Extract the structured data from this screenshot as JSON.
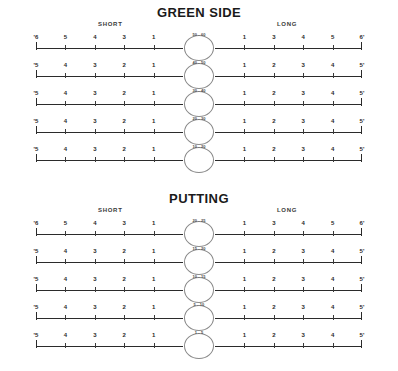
{
  "document": {
    "type": "golf-practice-dispersion-chart"
  },
  "sections": [
    {
      "id": "green-side",
      "title": "GREEN SIDE",
      "zones": {
        "short": "SHORT",
        "long": "LONG"
      },
      "rows": [
        {
          "circle_label": "50 - 60",
          "left_end": "'6",
          "right_end": "6'",
          "left_numbers": [
            "5",
            "4",
            "3",
            "1"
          ],
          "right_numbers": [
            "1",
            "3",
            "4",
            "5"
          ]
        },
        {
          "circle_label": "40 - 50",
          "left_end": "'5",
          "right_end": "5'",
          "left_numbers": [
            "4",
            "3",
            "2",
            "1"
          ],
          "right_numbers": [
            "1",
            "2",
            "3",
            "4"
          ]
        },
        {
          "circle_label": "30 - 40",
          "left_end": "'5",
          "right_end": "5'",
          "left_numbers": [
            "4",
            "3",
            "2",
            "1"
          ],
          "right_numbers": [
            "1",
            "2",
            "3",
            "4"
          ]
        },
        {
          "circle_label": "20 - 30",
          "left_end": "'5",
          "right_end": "5'",
          "left_numbers": [
            "4",
            "3",
            "2",
            "1"
          ],
          "right_numbers": [
            "1",
            "2",
            "3",
            "4"
          ]
        },
        {
          "circle_label": "10 - 20",
          "left_end": "'5",
          "right_end": "5'",
          "left_numbers": [
            "4",
            "3",
            "2",
            "1"
          ],
          "right_numbers": [
            "1",
            "2",
            "3",
            "4"
          ]
        }
      ]
    },
    {
      "id": "putting",
      "title": "PUTTING",
      "zones": {
        "short": "SHORT",
        "long": "LONG"
      },
      "rows": [
        {
          "circle_label": "20 - 25",
          "left_end": "'6",
          "right_end": "6'",
          "left_numbers": [
            "5",
            "4",
            "3",
            "1"
          ],
          "right_numbers": [
            "1",
            "3",
            "4",
            "5"
          ]
        },
        {
          "circle_label": "15 - 20",
          "left_end": "'5",
          "right_end": "5'",
          "left_numbers": [
            "4",
            "3",
            "2",
            "1"
          ],
          "right_numbers": [
            "1",
            "2",
            "3",
            "4"
          ]
        },
        {
          "circle_label": "10 - 15",
          "left_end": "'5",
          "right_end": "5'",
          "left_numbers": [
            "4",
            "3",
            "2",
            "1"
          ],
          "right_numbers": [
            "1",
            "2",
            "3",
            "4"
          ]
        },
        {
          "circle_label": "5 - 10",
          "left_end": "'5",
          "right_end": "5'",
          "left_numbers": [
            "4",
            "3",
            "2",
            "1"
          ],
          "right_numbers": [
            "1",
            "2",
            "3",
            "4"
          ]
        },
        {
          "circle_label": "1 - 5",
          "left_end": "'5",
          "right_end": "5'",
          "left_numbers": [
            "4",
            "3",
            "2",
            "1"
          ],
          "right_numbers": [
            "1",
            "2",
            "3",
            "4"
          ]
        }
      ]
    }
  ],
  "colors": {
    "ink": "#2b2b2b",
    "circle_stroke": "#8a8a8a",
    "background": "#ffffff"
  }
}
